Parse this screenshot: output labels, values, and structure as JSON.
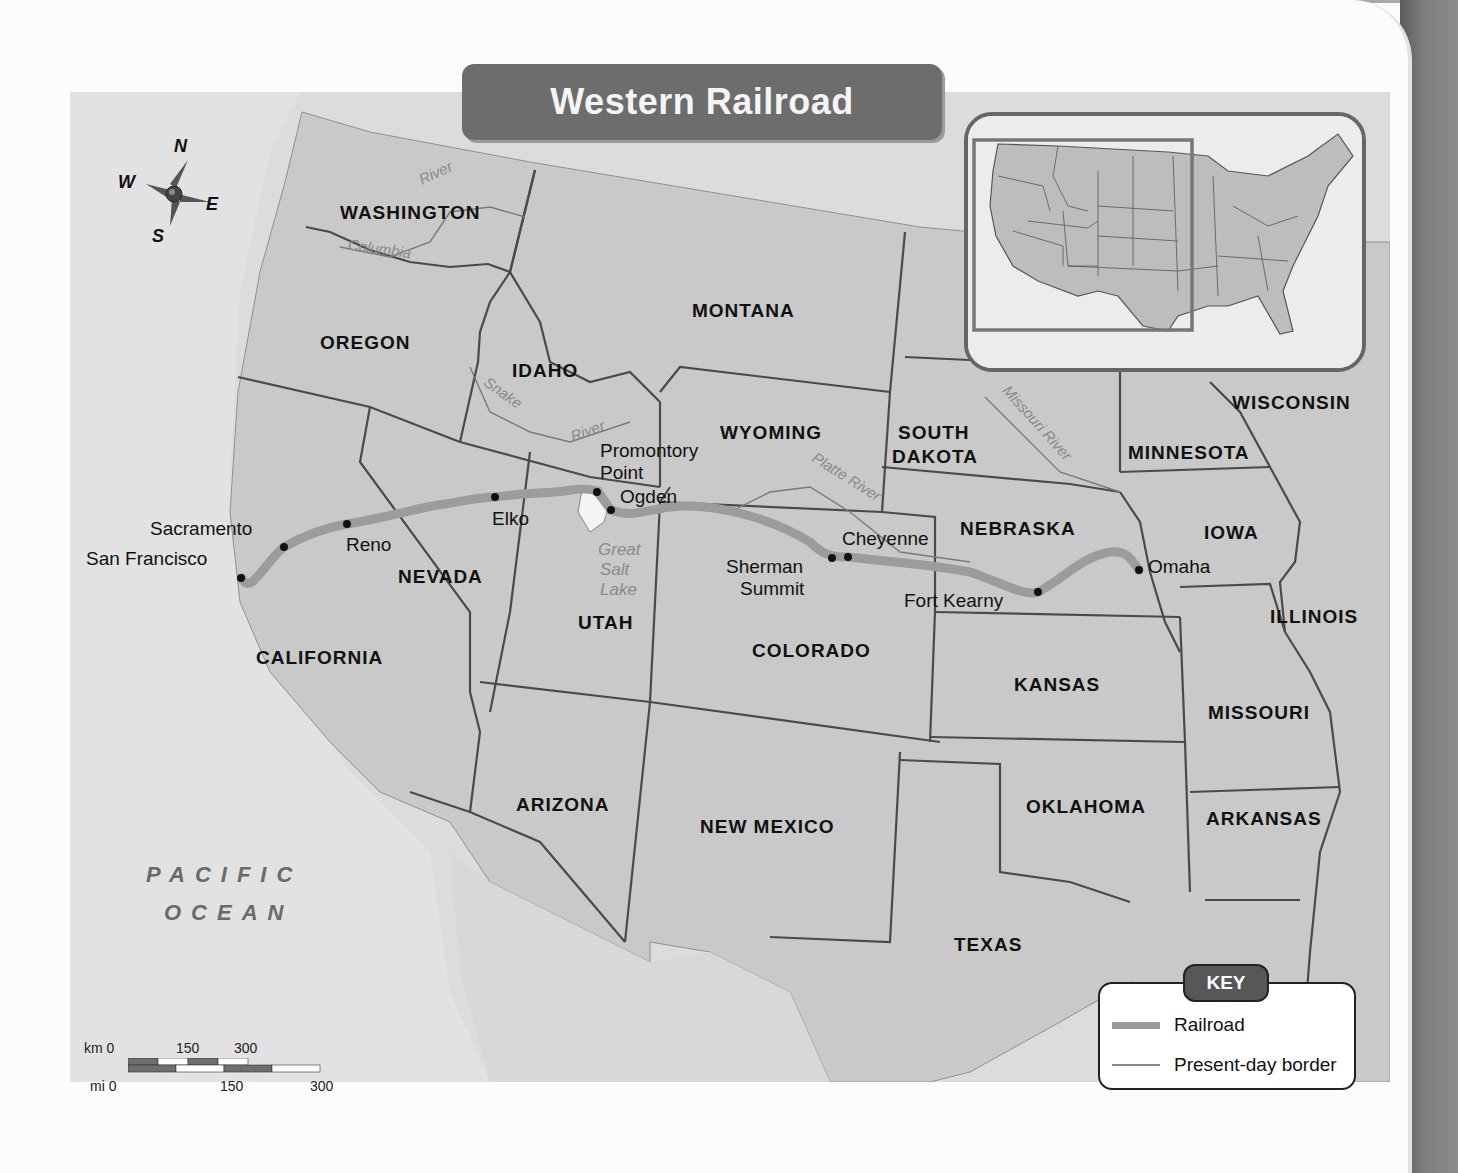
{
  "title": "Western Railroad",
  "compass": {
    "n": "N",
    "e": "E",
    "s": "S",
    "w": "W"
  },
  "ocean": {
    "line1": "PACIFIC",
    "line2": "OCEAN"
  },
  "states": [
    {
      "name": "WASHINGTON",
      "x": 270,
      "y": 110
    },
    {
      "name": "OREGON",
      "x": 250,
      "y": 240
    },
    {
      "name": "IDAHO",
      "x": 442,
      "y": 268
    },
    {
      "name": "MONTANA",
      "x": 622,
      "y": 208
    },
    {
      "name": "WYOMING",
      "x": 650,
      "y": 330
    },
    {
      "name": "SOUTH",
      "x": 828,
      "y": 330
    },
    {
      "name": "DAKOTA",
      "x": 822,
      "y": 354
    },
    {
      "name": "MINNESOTA",
      "x": 1058,
      "y": 350
    },
    {
      "name": "WISCONSIN",
      "x": 1162,
      "y": 300
    },
    {
      "name": "NEBRASKA",
      "x": 890,
      "y": 426
    },
    {
      "name": "IOWA",
      "x": 1134,
      "y": 430
    },
    {
      "name": "NEVADA",
      "x": 328,
      "y": 474
    },
    {
      "name": "UTAH",
      "x": 508,
      "y": 520
    },
    {
      "name": "CALIFORNIA",
      "x": 186,
      "y": 555
    },
    {
      "name": "COLORADO",
      "x": 682,
      "y": 548
    },
    {
      "name": "KANSAS",
      "x": 944,
      "y": 582
    },
    {
      "name": "ILLINOIS",
      "x": 1200,
      "y": 514
    },
    {
      "name": "MISSOURI",
      "x": 1138,
      "y": 610
    },
    {
      "name": "ARIZONA",
      "x": 446,
      "y": 702
    },
    {
      "name": "NEW MEXICO",
      "x": 630,
      "y": 724
    },
    {
      "name": "OKLAHOMA",
      "x": 956,
      "y": 704
    },
    {
      "name": "ARKANSAS",
      "x": 1136,
      "y": 716
    },
    {
      "name": "TEXAS",
      "x": 884,
      "y": 842
    }
  ],
  "cities": [
    {
      "name": "San Francisco",
      "x": 16,
      "y": 456,
      "dot_x": 171,
      "dot_y": 486
    },
    {
      "name": "Sacramento",
      "x": 80,
      "y": 426,
      "dot_x": 214,
      "dot_y": 455
    },
    {
      "name": "Reno",
      "x": 276,
      "y": 442,
      "dot_x": 277,
      "dot_y": 432
    },
    {
      "name": "Elko",
      "x": 422,
      "y": 416,
      "dot_x": 425,
      "dot_y": 405
    },
    {
      "name": "Promontory",
      "x": 530,
      "y": 348
    },
    {
      "name": "Point",
      "x": 530,
      "y": 370,
      "dot_x": 527,
      "dot_y": 400
    },
    {
      "name": "Ogden",
      "x": 550,
      "y": 394,
      "dot_x": 541,
      "dot_y": 418
    },
    {
      "name": "Cheyenne",
      "x": 772,
      "y": 436,
      "dot_x": 778,
      "dot_y": 465
    },
    {
      "name": "Sherman",
      "x": 656,
      "y": 464
    },
    {
      "name": "Summit",
      "x": 670,
      "y": 486,
      "dot_x": 762,
      "dot_y": 466
    },
    {
      "name": "Fort Kearny",
      "x": 834,
      "y": 498,
      "dot_x": 968,
      "dot_y": 500
    },
    {
      "name": "Omaha",
      "x": 1078,
      "y": 464,
      "dot_x": 1069,
      "dot_y": 478
    }
  ],
  "rivers": [
    {
      "name": "River",
      "x": 348,
      "y": 72,
      "rotate": -25
    },
    {
      "name": "Columbia",
      "x": 278,
      "y": 148,
      "rotate": 8
    },
    {
      "name": "Snake",
      "x": 412,
      "y": 292,
      "rotate": 35
    },
    {
      "name": "River",
      "x": 500,
      "y": 330,
      "rotate": -20
    },
    {
      "name": "Platte River",
      "x": 738,
      "y": 376,
      "rotate": 32
    },
    {
      "name": "Missouri River",
      "x": 920,
      "y": 322,
      "rotate": 48
    },
    {
      "name": "Great",
      "x": 528,
      "y": 448,
      "rotate": 0
    },
    {
      "name": "Salt",
      "x": 530,
      "y": 468,
      "rotate": 0
    },
    {
      "name": "Lake",
      "x": 530,
      "y": 488,
      "rotate": 0
    }
  ],
  "key": {
    "title": "KEY",
    "items": [
      {
        "label": "Railroad",
        "type": "railroad",
        "color": "#9a9a9a"
      },
      {
        "label": "Present-day border",
        "type": "border",
        "color": "#8a8a8a"
      }
    ]
  },
  "scale": {
    "km_label": "km 0",
    "km_ticks": [
      "150",
      "300"
    ],
    "mi_label": "mi 0",
    "mi_ticks": [
      "150",
      "300"
    ]
  },
  "colors": {
    "land": "#c7c7c7",
    "water": "#e8e8e8",
    "border": "#4a4a4a",
    "railroad": "#9c9c9c",
    "title_bg": "#6d6d6d"
  }
}
